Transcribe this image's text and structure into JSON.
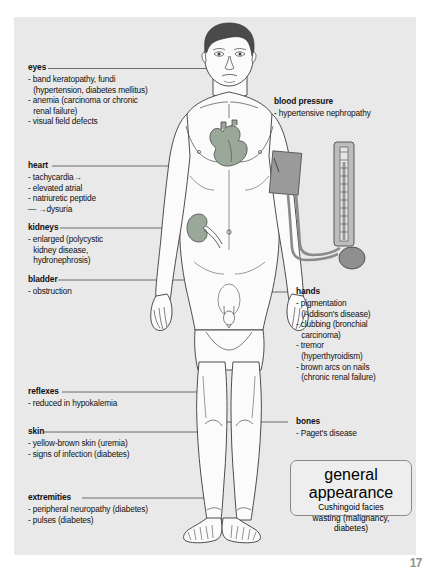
{
  "page": {
    "number": "17",
    "background_color": "#ffffff",
    "panel_color": "#e9e9e9"
  },
  "figure": {
    "name": "male-body-outline",
    "skin_color": "#fbfbfb",
    "outline_color": "#3a3a3a",
    "hair_color": "#4a4a4a",
    "organ_color": "#9aa89a",
    "device_color": "#9a9a9a"
  },
  "labels": {
    "eyes": {
      "heading": "eyes",
      "items": [
        "- band keratopathy, fundi",
        "(hypertension, diabetes mellitus)",
        "- anemia (carcinoma or chronic",
        "renal failure)",
        "- visual field defects"
      ]
    },
    "heart": {
      "heading": "heart",
      "items": [
        "- tachycardia→",
        "- elevated atrial",
        "- natriuretic peptide",
        "— →dysuria"
      ]
    },
    "kidneys": {
      "heading": "kidneys",
      "items": [
        "- enlarged (polycystic",
        "kidney disease,",
        "hydronephrosis)"
      ]
    },
    "bladder": {
      "heading": "bladder",
      "items": [
        "- obstruction"
      ]
    },
    "reflexes": {
      "heading": "reflexes",
      "items": [
        "- reduced in hypokalemia"
      ]
    },
    "skin": {
      "heading": "skin",
      "items": [
        "- yellow-brown skin (uremia)",
        "- signs of infection (diabetes)"
      ]
    },
    "extremities": {
      "heading": "extremities",
      "items": [
        "- peripheral neuropathy (diabetes)",
        "- pulses (diabetes)"
      ]
    },
    "blood_pressure": {
      "heading": "blood pressure",
      "items": [
        "- hypertensive nephropathy"
      ]
    },
    "hands": {
      "heading": "hands",
      "items": [
        "- pigmentation",
        "(Addison's disease)",
        "- clubbing (bronchial",
        "carcinoma)",
        "- tremor",
        "(hyperthyroidism)",
        "- brown arcs on nails",
        "(chronic renal failure)"
      ]
    },
    "bones": {
      "heading": "bones",
      "items": [
        "- Paget's disease"
      ]
    },
    "general_appearance": {
      "heading": "general appearance",
      "lines": [
        "Cushingoid facies",
        "wasting (malignancy,",
        "diabetes)"
      ]
    }
  }
}
